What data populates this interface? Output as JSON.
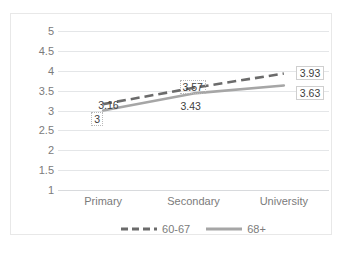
{
  "chart_data": {
    "type": "line",
    "title": "",
    "subtitle": "",
    "xlabel": "",
    "ylabel": "",
    "categories": [
      "Primary",
      "Secondary",
      "University"
    ],
    "ylim": [
      1,
      5
    ],
    "yticks": [
      "5",
      "4.5",
      "4",
      "3.5",
      "3",
      "2.5",
      "2",
      "1.5",
      "1"
    ],
    "ytick_values": [
      5,
      4.5,
      4,
      3.5,
      3,
      2.5,
      2,
      1.5,
      1
    ],
    "grid": true,
    "legend_position": "bottom",
    "series": [
      {
        "name": "60-67",
        "style": "dashed",
        "color": "#6b6b6b",
        "values": [
          3.16,
          3.57,
          3.93
        ],
        "labels": [
          "3.16",
          "3.57",
          "3.93"
        ]
      },
      {
        "name": "68+",
        "style": "solid",
        "color": "#a6a6a6",
        "values": [
          3.0,
          3.43,
          3.63
        ],
        "labels": [
          "3",
          "3.43",
          "3.63"
        ]
      }
    ],
    "annotations": [
      {
        "text": "3.16",
        "series": "60-67",
        "category": "Primary"
      },
      {
        "text": "3",
        "series": "68+",
        "category": "Primary"
      },
      {
        "text": "3.57",
        "series": "60-67",
        "category": "Secondary"
      },
      {
        "text": "3.43",
        "series": "68+",
        "category": "Secondary"
      },
      {
        "text": "3.93",
        "series": "60-67",
        "category": "University"
      },
      {
        "text": "3.63",
        "series": "68+",
        "category": "University"
      }
    ]
  },
  "axis": {
    "y_ticks": [
      {
        "label": "5"
      },
      {
        "label": "4.5"
      },
      {
        "label": "4"
      },
      {
        "label": "3.5"
      },
      {
        "label": "3"
      },
      {
        "label": "2.5"
      },
      {
        "label": "2"
      },
      {
        "label": "1.5"
      },
      {
        "label": "1"
      }
    ],
    "x_ticks": [
      {
        "label": "Primary"
      },
      {
        "label": "Secondary"
      },
      {
        "label": "University"
      }
    ]
  },
  "legend": {
    "entries": [
      {
        "label": "60-67",
        "style": "dashed",
        "color": "#6b6b6b"
      },
      {
        "label": "68+",
        "style": "solid",
        "color": "#a6a6a6"
      }
    ]
  },
  "labels": {
    "primary_dashed": "3.16",
    "primary_solid": "3",
    "secondary_dashed": "3.57",
    "secondary_solid": "3.43",
    "university_dashed": "3.93",
    "university_solid": "3.63"
  }
}
